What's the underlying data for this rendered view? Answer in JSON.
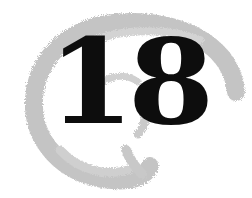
{
  "chapter": {
    "number": "18",
    "number_color": "#0d0d0d",
    "swirl_color": "#c4c4c4",
    "background": "#ffffff"
  }
}
